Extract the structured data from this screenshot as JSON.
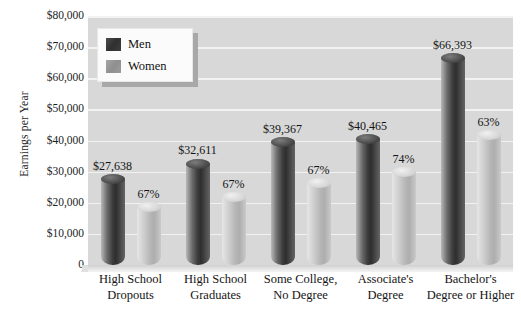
{
  "chart_data": {
    "type": "bar",
    "title": "",
    "xlabel": "",
    "ylabel": "Earnings per Year",
    "ylim": [
      0,
      80000
    ],
    "grid": true,
    "legend_position": "top-left",
    "categories": [
      "High School Dropouts",
      "High School Graduates",
      "Some College, No Degree",
      "Associate's Degree",
      "Bachelor's Degree or Higher"
    ],
    "category_lines": [
      [
        "High School",
        "Dropouts"
      ],
      [
        "High School",
        "Graduates"
      ],
      [
        "Some College,",
        "No Degree"
      ],
      [
        "Associate's",
        "Degree"
      ],
      [
        "Bachelor's",
        "Degree or Higher"
      ]
    ],
    "series": [
      {
        "name": "Men",
        "values": [
          27638,
          32611,
          39367,
          40465,
          66393
        ],
        "labels": [
          "$27,638",
          "$32,611",
          "$39,367",
          "$40,465",
          "$66,393"
        ]
      },
      {
        "name": "Women",
        "values": [
          18517,
          21849,
          26376,
          29944,
          41828
        ],
        "labels": [
          "67%",
          "67%",
          "67%",
          "74%",
          "63%"
        ]
      }
    ],
    "y_ticks": [
      0,
      10000,
      20000,
      30000,
      40000,
      50000,
      60000,
      70000,
      80000
    ],
    "y_tick_labels": [
      "0",
      "$10,000",
      "$20,000",
      "$30,000",
      "$40,000",
      "$50,000",
      "$60,000",
      "$70,000",
      "$80,000"
    ],
    "colors": {
      "men": "#333333",
      "women": "#b6b6b6",
      "plot_background": "#d8d8d8",
      "gridline": "#f2f2f2",
      "text": "#141414"
    }
  },
  "legend": {
    "items": [
      {
        "label": "Men",
        "key": "men"
      },
      {
        "label": "Women",
        "key": "women"
      }
    ]
  }
}
